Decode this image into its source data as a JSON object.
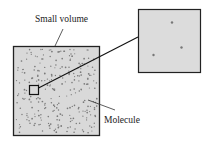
{
  "diagram": {
    "labels": {
      "small_volume": "Small volume",
      "molecule": "Molecule"
    },
    "colors": {
      "box_fill": "#d9d9d9",
      "zoom_fill": "#dcdcdc",
      "outline": "#222222",
      "molecule_dot": "#7a7a7a"
    },
    "molecule_count_main": 260,
    "molecule_count_zoom": 3
  }
}
